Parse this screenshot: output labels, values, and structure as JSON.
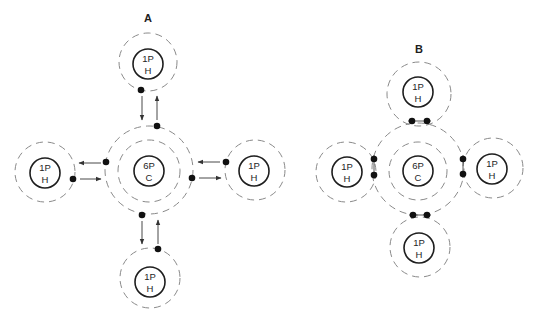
{
  "diagram_a": {
    "title": "A",
    "carbon": {
      "line1": "6P",
      "line2": "C"
    },
    "hydrogens": [
      {
        "position": "top",
        "line1": "1P",
        "line2": "H"
      },
      {
        "position": "left",
        "line1": "1P",
        "line2": "H"
      },
      {
        "position": "right",
        "line1": "1P",
        "line2": "H"
      },
      {
        "position": "bottom",
        "line1": "1P",
        "line2": "H"
      }
    ]
  },
  "diagram_b": {
    "title": "B",
    "carbon": {
      "line1": "6P",
      "line2": "C"
    },
    "hydrogens": [
      {
        "position": "top",
        "line1": "1P",
        "line2": "H"
      },
      {
        "position": "left",
        "line1": "1P",
        "line2": "H"
      },
      {
        "position": "right",
        "line1": "1P",
        "line2": "H"
      },
      {
        "position": "bottom",
        "line1": "1P",
        "line2": "H"
      }
    ]
  },
  "colors": {
    "nucleus_stroke": "#1e1e1e",
    "shell_stroke": "#8a8a8a",
    "electron": "#111111",
    "background": "#ffffff"
  }
}
